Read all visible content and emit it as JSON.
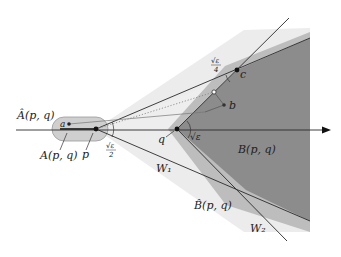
{
  "figure": {
    "type": "geometric-diagram",
    "labels": {
      "A_hat": "Â(p, q)",
      "A": "A(p, q)",
      "B": "B(p, q)",
      "B_hat": "B̂(p, q)",
      "W1": "W₁",
      "W2": "W₂",
      "p": "p",
      "q": "q",
      "a": "a",
      "b": "b",
      "c": "c",
      "angle_p": "√ε/2",
      "angle_p_num": "√ε",
      "angle_p_den": "2",
      "angle_q": "√ε",
      "angle_c_num": "√ε",
      "angle_c_den": "4"
    },
    "points": {
      "p": [
        96,
        129
      ],
      "q": [
        177,
        129
      ],
      "a": [
        69,
        124
      ],
      "b": [
        224,
        105
      ],
      "c": [
        237,
        70
      ],
      "open_point": [
        214,
        92
      ]
    },
    "colors": {
      "dark_region": "#8a8a8a",
      "mid_region": "#b9b9b9",
      "light_region": "#e6e6e6",
      "capsule": "#cfcfcf",
      "line": "#2a2a2a"
    }
  }
}
